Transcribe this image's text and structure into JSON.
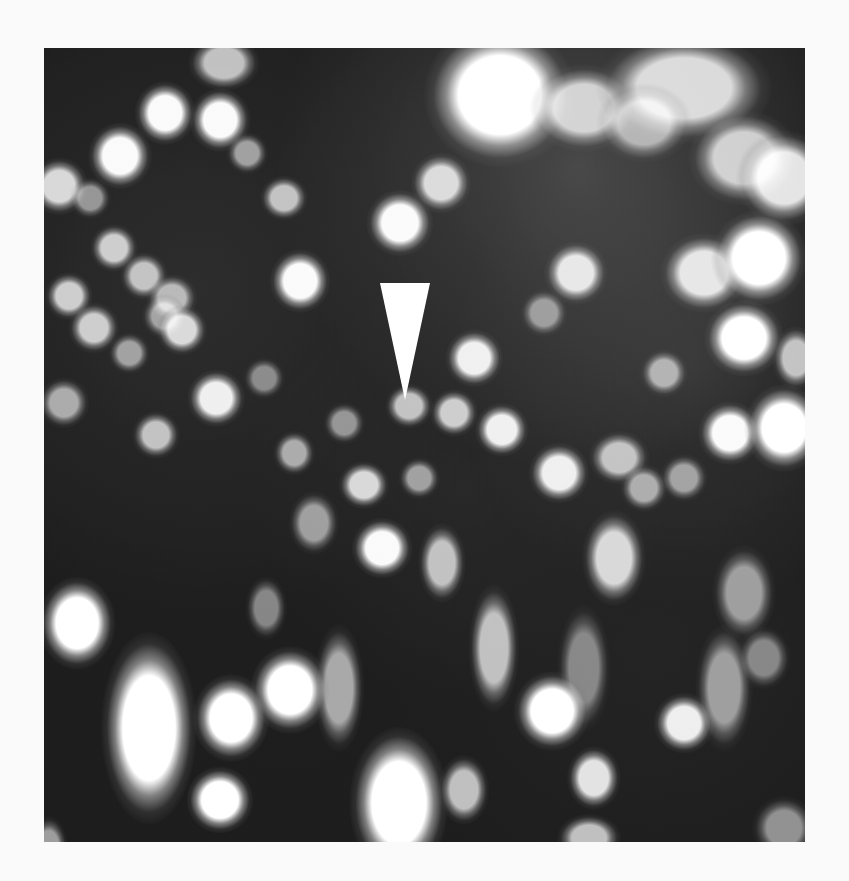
{
  "figure": {
    "background": "#2a2a2a",
    "blob_color": "#f4f4f4",
    "arrow": {
      "x": 336,
      "y": 235,
      "width": 50,
      "height": 117,
      "color": "#f2f2f2",
      "direction": "down"
    },
    "blobs": [
      {
        "x": 456,
        "y": 47,
        "w": 95,
        "h": 90,
        "o": 1.0
      },
      {
        "x": 540,
        "y": 60,
        "w": 70,
        "h": 55,
        "o": 0.75
      },
      {
        "x": 640,
        "y": 40,
        "w": 110,
        "h": 70,
        "o": 0.8
      },
      {
        "x": 700,
        "y": 110,
        "w": 70,
        "h": 60,
        "o": 0.75
      },
      {
        "x": 740,
        "y": 130,
        "w": 60,
        "h": 60,
        "o": 0.85
      },
      {
        "x": 600,
        "y": 75,
        "w": 60,
        "h": 50,
        "o": 0.6
      },
      {
        "x": 180,
        "y": 15,
        "w": 45,
        "h": 35,
        "o": 0.7
      },
      {
        "x": 121,
        "y": 65,
        "w": 38,
        "h": 40,
        "o": 0.95
      },
      {
        "x": 176,
        "y": 72,
        "w": 38,
        "h": 40,
        "o": 0.95
      },
      {
        "x": 76,
        "y": 108,
        "w": 40,
        "h": 42,
        "o": 0.95
      },
      {
        "x": 15,
        "y": 138,
        "w": 36,
        "h": 36,
        "o": 0.8
      },
      {
        "x": 46,
        "y": 150,
        "w": 26,
        "h": 26,
        "o": 0.5
      },
      {
        "x": 203,
        "y": 105,
        "w": 26,
        "h": 26,
        "o": 0.55
      },
      {
        "x": 240,
        "y": 150,
        "w": 30,
        "h": 28,
        "o": 0.7
      },
      {
        "x": 356,
        "y": 175,
        "w": 42,
        "h": 42,
        "o": 0.95
      },
      {
        "x": 397,
        "y": 135,
        "w": 38,
        "h": 38,
        "o": 0.8
      },
      {
        "x": 256,
        "y": 233,
        "w": 38,
        "h": 40,
        "o": 0.95
      },
      {
        "x": 70,
        "y": 200,
        "w": 30,
        "h": 30,
        "o": 0.75
      },
      {
        "x": 100,
        "y": 228,
        "w": 30,
        "h": 30,
        "o": 0.7
      },
      {
        "x": 128,
        "y": 250,
        "w": 32,
        "h": 30,
        "o": 0.65
      },
      {
        "x": 25,
        "y": 248,
        "w": 30,
        "h": 30,
        "o": 0.75
      },
      {
        "x": 50,
        "y": 280,
        "w": 32,
        "h": 32,
        "o": 0.75
      },
      {
        "x": 85,
        "y": 305,
        "w": 26,
        "h": 26,
        "o": 0.55
      },
      {
        "x": 120,
        "y": 268,
        "w": 28,
        "h": 28,
        "o": 0.55
      },
      {
        "x": 138,
        "y": 282,
        "w": 32,
        "h": 32,
        "o": 0.8
      },
      {
        "x": 172,
        "y": 350,
        "w": 36,
        "h": 36,
        "o": 0.9
      },
      {
        "x": 112,
        "y": 387,
        "w": 30,
        "h": 30,
        "o": 0.7
      },
      {
        "x": 20,
        "y": 355,
        "w": 32,
        "h": 32,
        "o": 0.6
      },
      {
        "x": 220,
        "y": 330,
        "w": 26,
        "h": 26,
        "o": 0.45
      },
      {
        "x": 250,
        "y": 405,
        "w": 26,
        "h": 28,
        "o": 0.6
      },
      {
        "x": 532,
        "y": 225,
        "w": 40,
        "h": 40,
        "o": 0.85
      },
      {
        "x": 430,
        "y": 310,
        "w": 36,
        "h": 36,
        "o": 0.9
      },
      {
        "x": 500,
        "y": 265,
        "w": 30,
        "h": 30,
        "o": 0.5
      },
      {
        "x": 660,
        "y": 225,
        "w": 55,
        "h": 50,
        "o": 0.85
      },
      {
        "x": 715,
        "y": 210,
        "w": 60,
        "h": 60,
        "o": 1.0
      },
      {
        "x": 700,
        "y": 290,
        "w": 50,
        "h": 48,
        "o": 1.0
      },
      {
        "x": 620,
        "y": 325,
        "w": 30,
        "h": 30,
        "o": 0.6
      },
      {
        "x": 752,
        "y": 310,
        "w": 30,
        "h": 40,
        "o": 0.7
      },
      {
        "x": 686,
        "y": 385,
        "w": 40,
        "h": 40,
        "o": 0.95
      },
      {
        "x": 740,
        "y": 380,
        "w": 50,
        "h": 55,
        "o": 1.0
      },
      {
        "x": 410,
        "y": 365,
        "w": 30,
        "h": 30,
        "o": 0.75
      },
      {
        "x": 458,
        "y": 382,
        "w": 34,
        "h": 34,
        "o": 0.9
      },
      {
        "x": 365,
        "y": 358,
        "w": 30,
        "h": 28,
        "o": 0.7
      },
      {
        "x": 300,
        "y": 375,
        "w": 26,
        "h": 26,
        "o": 0.5
      },
      {
        "x": 320,
        "y": 437,
        "w": 32,
        "h": 30,
        "o": 0.8
      },
      {
        "x": 375,
        "y": 430,
        "w": 26,
        "h": 26,
        "o": 0.55
      },
      {
        "x": 515,
        "y": 425,
        "w": 38,
        "h": 38,
        "o": 0.9
      },
      {
        "x": 575,
        "y": 410,
        "w": 38,
        "h": 34,
        "o": 0.7
      },
      {
        "x": 600,
        "y": 440,
        "w": 30,
        "h": 30,
        "o": 0.6
      },
      {
        "x": 640,
        "y": 430,
        "w": 30,
        "h": 30,
        "o": 0.55
      },
      {
        "x": 270,
        "y": 475,
        "w": 32,
        "h": 40,
        "o": 0.55
      },
      {
        "x": 338,
        "y": 500,
        "w": 38,
        "h": 38,
        "o": 0.95
      },
      {
        "x": 398,
        "y": 515,
        "w": 30,
        "h": 50,
        "o": 0.7
      },
      {
        "x": 570,
        "y": 510,
        "w": 40,
        "h": 60,
        "o": 0.8
      },
      {
        "x": 450,
        "y": 600,
        "w": 32,
        "h": 80,
        "o": 0.7
      },
      {
        "x": 540,
        "y": 620,
        "w": 34,
        "h": 80,
        "o": 0.45
      },
      {
        "x": 222,
        "y": 560,
        "w": 26,
        "h": 40,
        "o": 0.45
      },
      {
        "x": 295,
        "y": 640,
        "w": 32,
        "h": 80,
        "o": 0.6
      },
      {
        "x": 33,
        "y": 575,
        "w": 48,
        "h": 58,
        "o": 1.0
      },
      {
        "x": 246,
        "y": 642,
        "w": 50,
        "h": 55,
        "o": 1.0
      },
      {
        "x": 187,
        "y": 670,
        "w": 48,
        "h": 55,
        "o": 1.0
      },
      {
        "x": 105,
        "y": 680,
        "w": 60,
        "h": 120,
        "o": 1.0
      },
      {
        "x": 176,
        "y": 752,
        "w": 42,
        "h": 42,
        "o": 1.0
      },
      {
        "x": 355,
        "y": 755,
        "w": 62,
        "h": 95,
        "o": 1.0
      },
      {
        "x": 508,
        "y": 663,
        "w": 48,
        "h": 50,
        "o": 1.0
      },
      {
        "x": 550,
        "y": 730,
        "w": 34,
        "h": 40,
        "o": 0.85
      },
      {
        "x": 420,
        "y": 742,
        "w": 32,
        "h": 44,
        "o": 0.7
      },
      {
        "x": 640,
        "y": 675,
        "w": 38,
        "h": 38,
        "o": 0.9
      },
      {
        "x": 680,
        "y": 640,
        "w": 36,
        "h": 80,
        "o": 0.55
      },
      {
        "x": 700,
        "y": 545,
        "w": 40,
        "h": 60,
        "o": 0.55
      },
      {
        "x": 720,
        "y": 610,
        "w": 34,
        "h": 40,
        "o": 0.45
      },
      {
        "x": 740,
        "y": 780,
        "w": 40,
        "h": 40,
        "o": 0.5
      },
      {
        "x": 545,
        "y": 790,
        "w": 40,
        "h": 30,
        "o": 0.7
      },
      {
        "x": 5,
        "y": 800,
        "w": 24,
        "h": 40,
        "o": 0.55
      }
    ]
  }
}
